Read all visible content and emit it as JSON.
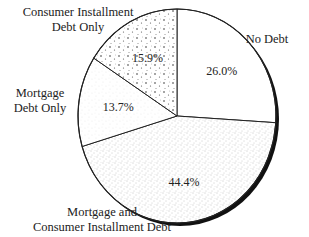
{
  "chart_data": {
    "type": "pie",
    "title": "",
    "start": "top",
    "direction": "clockwise",
    "slices": [
      {
        "name": "No Debt",
        "value": 26.0,
        "label": "26.0%",
        "pattern": "none"
      },
      {
        "name": "Mortgage and Consumer Installment Debt",
        "value": 44.4,
        "label": "44.4%",
        "pattern": "fine-stipple"
      },
      {
        "name": "Mortgage Debt Only",
        "value": 13.7,
        "label": "13.7%",
        "pattern": "light-stipple"
      },
      {
        "name": "Consumer Installment Debt Only",
        "value": 15.9,
        "label": "15.9%",
        "pattern": "coarse-dots"
      }
    ],
    "category_labels": [
      {
        "lines": [
          "No Debt"
        ]
      },
      {
        "lines": [
          "Mortgage and",
          "Consumer Installment Debt"
        ]
      },
      {
        "lines": [
          "Mortgage",
          "Debt Only"
        ]
      },
      {
        "lines": [
          "Consumer Installment",
          "Debt Only"
        ]
      }
    ],
    "colors": {
      "outline": "#222222",
      "fill": "#ffffff",
      "shadow": "#111111"
    }
  }
}
